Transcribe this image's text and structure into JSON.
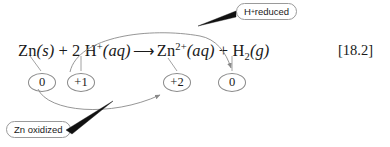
{
  "figure": {
    "equation_number": "[18.2]",
    "equation": {
      "reactant_zn": "Zn",
      "reactant_zn_state": "(s)",
      "plus_1": " + ",
      "coefficient_h": "2 ",
      "reactant_h": "H",
      "reactant_h_charge": "+",
      "reactant_h_state": "(aq)",
      "reaction_arrow": "⟶",
      "product_zn": "Zn",
      "product_zn_charge": "2+",
      "product_zn_state": "(aq)",
      "plus_2": " + ",
      "product_h": "H",
      "product_h_subscript": "2",
      "product_h_state": "(g)"
    },
    "oxidation_numbers": {
      "zn_reactant": "0",
      "h_reactant": "+1",
      "zn_product": "+2",
      "h_product": "0"
    },
    "callouts": {
      "reduced_species": "H",
      "reduced_charge": "+",
      "reduced_text": " reduced",
      "oxidized_text": "Zn oxidized"
    },
    "colors": {
      "ink": "#1a1a1a",
      "line": "#8a8a8a",
      "pointer": "#111111",
      "background": "#ffffff"
    }
  }
}
